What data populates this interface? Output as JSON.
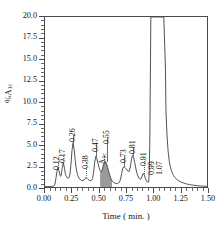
{
  "chart_data": {
    "type": "line",
    "title": "",
    "subtitle": "",
    "xlabel": "Time ( min. )",
    "ylabel": "%A1c",
    "ylabel_main": "%A",
    "ylabel_sub": "1c",
    "xlim": [
      0.0,
      1.5
    ],
    "ylim": [
      0.0,
      20.0
    ],
    "grid": false,
    "legend": "none",
    "x_ticks": [
      "0.00",
      "0.25",
      "0.50",
      "0.75",
      "1.00",
      "1.25",
      "1.50"
    ],
    "x_tick_values": [
      0.0,
      0.25,
      0.5,
      0.75,
      1.0,
      1.25,
      1.5
    ],
    "x_minor_step": 0.05,
    "y_ticks": [
      "0.0",
      "2.5",
      "5.0",
      "7.5",
      "10.0",
      "12.5",
      "15.0",
      "17.5",
      "20.0"
    ],
    "y_tick_values": [
      0.0,
      2.5,
      5.0,
      7.5,
      10.0,
      12.5,
      15.0,
      17.5,
      20.0
    ],
    "y_minor_step": 0.5,
    "annotations": [
      {
        "label": "0.12",
        "x": 0.12,
        "peak_height": 2.3,
        "label_y": 3.2,
        "leader": "dotted"
      },
      {
        "label": "0.17",
        "x": 0.17,
        "peak_height": 2.9,
        "label_y": 4.0,
        "leader": "dotted"
      },
      {
        "label": "0.26",
        "x": 0.26,
        "peak_height": 5.2,
        "label_y": 6.4,
        "leader": "solid"
      },
      {
        "label": "0.38",
        "x": 0.38,
        "peak_height": 1.1,
        "label_y": 3.3,
        "leader": "dotted"
      },
      {
        "label": "0.47",
        "x": 0.47,
        "peak_height": 3.6,
        "label_y": 5.2,
        "leader": "solid"
      },
      {
        "label": "A1c",
        "x": 0.545,
        "peak_height": 3.0,
        "label_y": 4.0,
        "leader": "dotted",
        "subscript": "1c",
        "main": "A"
      },
      {
        "label": "0.55",
        "x": 0.575,
        "peak_height": 3.0,
        "label_y": 6.2,
        "leader": "solid"
      },
      {
        "label": "0.73",
        "x": 0.73,
        "peak_height": 2.4,
        "label_y": 4.0,
        "leader": "solid"
      },
      {
        "label": "0.81",
        "x": 0.81,
        "peak_height": 3.7,
        "label_y": 5.0,
        "leader": "solid"
      },
      {
        "label": "0.91",
        "x": 0.91,
        "peak_height": 1.6,
        "label_y": 3.6,
        "leader": "dotted"
      },
      {
        "label": "0.99",
        "x": 0.985,
        "peak_height": 20.0,
        "label_y": 2.6,
        "leader": "solid"
      },
      {
        "label": "1.07",
        "x": 1.055,
        "peak_height": 20.0,
        "label_y": 2.6,
        "leader": "solid"
      }
    ],
    "shaded_peak": {
      "label": "A1c",
      "center": 0.555,
      "height": 3.0,
      "fill_color": "#9a9a9a"
    },
    "series": [
      {
        "name": "chromatogram",
        "color": "#3d3d3d",
        "points": [
          [
            0.0,
            0.05
          ],
          [
            0.02,
            0.05
          ],
          [
            0.04,
            0.05
          ],
          [
            0.06,
            0.06
          ],
          [
            0.08,
            0.1
          ],
          [
            0.09,
            0.25
          ],
          [
            0.1,
            0.9
          ],
          [
            0.11,
            1.8
          ],
          [
            0.12,
            2.3
          ],
          [
            0.13,
            1.9
          ],
          [
            0.14,
            1.35
          ],
          [
            0.145,
            1.25
          ],
          [
            0.15,
            1.4
          ],
          [
            0.16,
            2.3
          ],
          [
            0.17,
            2.9
          ],
          [
            0.18,
            2.2
          ],
          [
            0.19,
            1.45
          ],
          [
            0.2,
            1.15
          ],
          [
            0.21,
            1.05
          ],
          [
            0.22,
            1.05
          ],
          [
            0.23,
            1.4
          ],
          [
            0.24,
            2.6
          ],
          [
            0.25,
            4.3
          ],
          [
            0.26,
            5.2
          ],
          [
            0.27,
            4.4
          ],
          [
            0.28,
            3.1
          ],
          [
            0.29,
            2.1
          ],
          [
            0.3,
            1.5
          ],
          [
            0.31,
            1.15
          ],
          [
            0.32,
            0.95
          ],
          [
            0.33,
            0.82
          ],
          [
            0.34,
            0.76
          ],
          [
            0.35,
            0.75
          ],
          [
            0.36,
            0.82
          ],
          [
            0.37,
            0.98
          ],
          [
            0.38,
            1.1
          ],
          [
            0.39,
            1.02
          ],
          [
            0.4,
            0.88
          ],
          [
            0.41,
            0.78
          ],
          [
            0.42,
            0.74
          ],
          [
            0.43,
            0.78
          ],
          [
            0.44,
            1.0
          ],
          [
            0.45,
            1.7
          ],
          [
            0.46,
            2.9
          ],
          [
            0.47,
            3.6
          ],
          [
            0.48,
            3.35
          ],
          [
            0.49,
            2.8
          ],
          [
            0.5,
            2.3
          ],
          [
            0.51,
            1.95
          ],
          [
            0.52,
            1.8
          ],
          [
            0.53,
            2.0
          ],
          [
            0.54,
            2.55
          ],
          [
            0.55,
            2.95
          ],
          [
            0.56,
            3.0
          ],
          [
            0.57,
            2.75
          ],
          [
            0.58,
            2.3
          ],
          [
            0.59,
            1.8
          ],
          [
            0.6,
            1.35
          ],
          [
            0.61,
            1.0
          ],
          [
            0.62,
            0.75
          ],
          [
            0.63,
            0.6
          ],
          [
            0.64,
            0.5
          ],
          [
            0.65,
            0.44
          ],
          [
            0.66,
            0.4
          ],
          [
            0.67,
            0.4
          ],
          [
            0.68,
            0.45
          ],
          [
            0.69,
            0.6
          ],
          [
            0.7,
            0.95
          ],
          [
            0.71,
            1.6
          ],
          [
            0.72,
            2.2
          ],
          [
            0.73,
            2.4
          ],
          [
            0.74,
            2.3
          ],
          [
            0.75,
            2.15
          ],
          [
            0.76,
            2.0
          ],
          [
            0.77,
            1.85
          ],
          [
            0.78,
            1.85
          ],
          [
            0.79,
            2.35
          ],
          [
            0.8,
            3.2
          ],
          [
            0.81,
            3.7
          ],
          [
            0.82,
            3.5
          ],
          [
            0.83,
            2.9
          ],
          [
            0.84,
            2.25
          ],
          [
            0.85,
            1.7
          ],
          [
            0.86,
            1.3
          ],
          [
            0.87,
            1.05
          ],
          [
            0.88,
            0.92
          ],
          [
            0.89,
            0.95
          ],
          [
            0.9,
            1.3
          ],
          [
            0.91,
            1.6
          ],
          [
            0.92,
            1.4
          ],
          [
            0.93,
            1.0
          ],
          [
            0.94,
            0.7
          ],
          [
            0.95,
            0.55
          ],
          [
            0.96,
            0.6
          ],
          [
            0.965,
            1.6
          ],
          [
            0.97,
            5.0
          ],
          [
            0.975,
            12.0
          ],
          [
            0.98,
            20.0
          ],
          [
            1.0,
            20.0
          ],
          [
            1.02,
            20.0
          ],
          [
            1.04,
            20.0
          ],
          [
            1.06,
            20.0
          ],
          [
            1.08,
            20.0
          ],
          [
            1.1,
            20.0
          ],
          [
            1.115,
            14.0
          ],
          [
            1.12,
            9.0
          ],
          [
            1.13,
            6.0
          ],
          [
            1.14,
            4.2
          ],
          [
            1.15,
            3.1
          ],
          [
            1.16,
            2.4
          ],
          [
            1.17,
            1.95
          ],
          [
            1.18,
            1.6
          ],
          [
            1.19,
            1.35
          ],
          [
            1.2,
            1.15
          ],
          [
            1.22,
            0.9
          ],
          [
            1.24,
            0.72
          ],
          [
            1.26,
            0.58
          ],
          [
            1.28,
            0.48
          ],
          [
            1.3,
            0.4
          ],
          [
            1.32,
            0.33
          ],
          [
            1.34,
            0.28
          ],
          [
            1.36,
            0.24
          ],
          [
            1.38,
            0.2
          ],
          [
            1.4,
            0.17
          ],
          [
            1.42,
            0.14
          ],
          [
            1.44,
            0.12
          ],
          [
            1.46,
            0.1
          ],
          [
            1.48,
            0.09
          ],
          [
            1.5,
            0.08
          ]
        ]
      }
    ]
  },
  "axis": {
    "y_title_main": "%A",
    "y_title_sub": "1c",
    "x_title": "Time ( min. )"
  },
  "colors": {
    "trace": "#3d3d3d",
    "frame": "#4a4a4a",
    "shade": "#9a9a9a",
    "text": "#141414",
    "leader": "#6d6d6d"
  }
}
